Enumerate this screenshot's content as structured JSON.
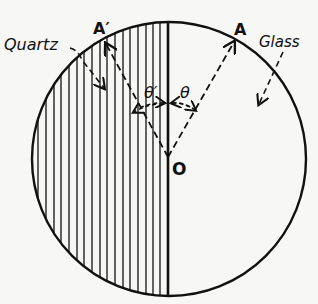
{
  "figure": {
    "labels": {
      "quartz": "Quartz",
      "glass": "Glass",
      "point_a_prime": "A′",
      "point_a": "A",
      "center": "O",
      "angle_theta_prime": "θ′",
      "angle_theta": "θ"
    },
    "colors": {
      "ink": "#111111",
      "paper": "#f7f7f5"
    }
  }
}
